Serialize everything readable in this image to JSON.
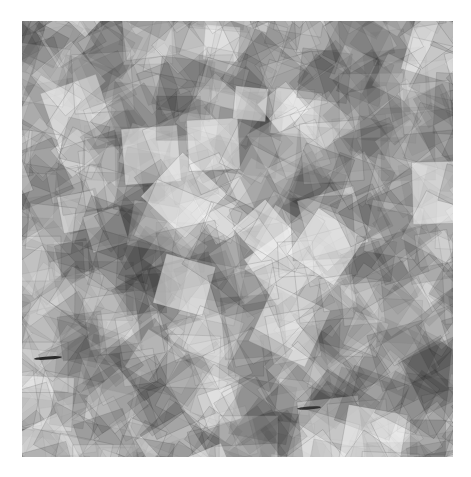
{
  "image": {
    "description": "Abstract pattern of overlapping translucent rotated grey squares forming a kaleidoscopic mosaic",
    "background": "#ffffff",
    "pattern_region": {
      "x": 22,
      "y": 21,
      "width": 431,
      "height": 436
    },
    "base_color": "#9a9a9a",
    "highlight_color": "#f2f2f2",
    "shadow_color": "#5a5a5a",
    "grid_cells": 12,
    "marks": [
      {
        "x": 12,
        "y": 337,
        "length": 28,
        "color": "#111111"
      },
      {
        "x": 275,
        "y": 387,
        "length": 24,
        "color": "#222222"
      }
    ]
  }
}
